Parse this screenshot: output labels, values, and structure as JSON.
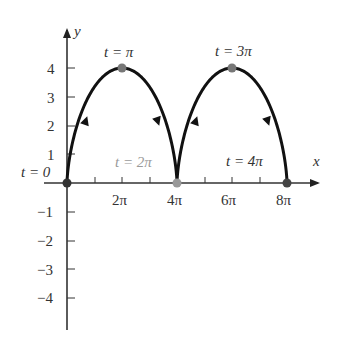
{
  "chart_data": {
    "type": "line",
    "title": "",
    "xlabel": "x",
    "ylabel": "y",
    "parametric": "x = 2(t - sin t), y = 2(1 - cos t)",
    "t_range": [
      "0",
      "4π"
    ],
    "x_ticks": [
      "2π",
      "4π",
      "6π",
      "8π"
    ],
    "y_ticks": [
      "4",
      "3",
      "2",
      "1",
      "−1",
      "−2",
      "−3",
      "−4"
    ],
    "xlim": [
      0,
      "8π"
    ],
    "ylim": [
      -4,
      4
    ],
    "grid": false,
    "points": [
      {
        "label": "t = 0",
        "x": "0",
        "y": 0
      },
      {
        "label": "t = π",
        "x": "2π",
        "y": 4
      },
      {
        "label": "t = 2π",
        "x": "4π",
        "y": 0
      },
      {
        "label": "t = 3π",
        "x": "6π",
        "y": 4
      },
      {
        "label": "t = 4π",
        "x": "8π",
        "y": 0
      }
    ],
    "colors": {
      "curve": "#111111",
      "points": "#777777",
      "axis": "#333333",
      "faded_label": "#9a9a9a"
    }
  },
  "labels": {
    "x_axis": "x",
    "y_axis": "y",
    "t0": "t = 0",
    "tpi": "t = π",
    "t2pi": "t = 2π",
    "t3pi": "t = 3π",
    "t4pi": "t = 4π",
    "xt1": "2π",
    "xt2": "4π",
    "xt3": "6π",
    "xt4": "8π",
    "y4": "4",
    "y3": "3",
    "y2": "2",
    "y1": "1",
    "yn1": "−1",
    "yn2": "−2",
    "yn3": "−3",
    "yn4": "−4"
  }
}
